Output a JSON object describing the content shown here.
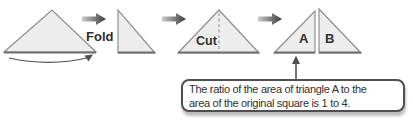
{
  "figure": {
    "labels": {
      "fold": "Fold",
      "cut": "Cut",
      "triangle_a": "A",
      "triangle_b": "B"
    },
    "callout": {
      "line1": "The ratio of the area of triangle A to the",
      "line2": "area of the original square is 1 to 4."
    },
    "icons": {
      "step_arrow": "right-block-arrow-icon",
      "fold_curve": "curved-fold-arrow-icon",
      "pointer": "up-arrow-icon"
    },
    "colors": {
      "shape_fill": "#ededed",
      "shape_stroke": "#8f8f8f",
      "base_stroke": "#6e6e6e",
      "arrow_light": "#c9c9c9",
      "arrow_dark": "#3c3c3c",
      "pointer_stroke": "#4f4f4f",
      "callout_border": "#4f4f4f",
      "callout_shadow": "#bdbdbd",
      "text": "#2f2f2f"
    }
  }
}
